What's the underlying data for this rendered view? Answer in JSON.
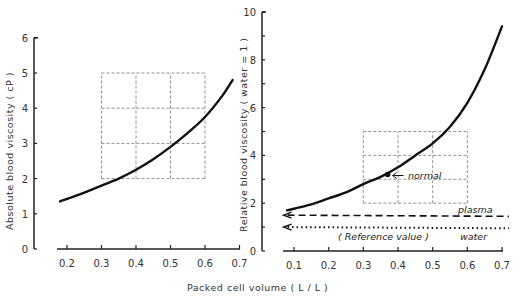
{
  "chart_data": [
    {
      "type": "line",
      "panel": "left",
      "title": "",
      "xlabel": "Packed cell volume (L/L)",
      "ylabel": "Absolute blood viscosity (cP)",
      "xlim": [
        0.17,
        0.7
      ],
      "ylim": [
        0,
        6
      ],
      "xticks": [
        0.2,
        0.3,
        0.4,
        0.5,
        0.6,
        0.7
      ],
      "xtick_labels": [
        "0.2",
        "0.3",
        "0.4",
        "0.5",
        "0.6",
        "0.7"
      ],
      "yticks": [
        0,
        1,
        2,
        3,
        4,
        5,
        6
      ],
      "ytick_labels": [
        "0",
        "1",
        "2",
        "3",
        "4",
        "5",
        "6"
      ],
      "grid": "dashed box x 0.3-0.6, y 2-5",
      "grid_box": {
        "x": [
          0.3,
          0.4,
          0.5,
          0.6
        ],
        "y": [
          2,
          3,
          4,
          5
        ]
      },
      "series": [
        {
          "name": "Absolute blood viscosity",
          "x": [
            0.18,
            0.25,
            0.3,
            0.35,
            0.4,
            0.45,
            0.5,
            0.55,
            0.6,
            0.65,
            0.68
          ],
          "y": [
            1.35,
            1.6,
            1.8,
            2.0,
            2.25,
            2.55,
            2.9,
            3.3,
            3.75,
            4.35,
            4.8
          ]
        }
      ]
    },
    {
      "type": "line",
      "panel": "right",
      "title": "",
      "xlabel": "Packed cell volume (L/L)",
      "ylabel": "Relative blood viscosity (water = 1)",
      "xlim": [
        0.07,
        0.72
      ],
      "ylim": [
        0,
        10
      ],
      "xticks": [
        0.1,
        0.2,
        0.3,
        0.4,
        0.5,
        0.6,
        0.7
      ],
      "xtick_labels": [
        "0.1",
        "0.2",
        "0.3",
        "0.4",
        "0.5",
        "0.6",
        "0.7"
      ],
      "yticks": [
        0,
        2,
        4,
        6,
        8,
        10
      ],
      "ytick_labels": [
        "0",
        "2",
        "4",
        "6",
        "8",
        "10"
      ],
      "grid": "dashed box x 0.3-0.6, y 2-5",
      "grid_box": {
        "x": [
          0.3,
          0.4,
          0.5,
          0.6
        ],
        "y": [
          2,
          3,
          4,
          5
        ]
      },
      "series": [
        {
          "name": "Relative blood viscosity",
          "x": [
            0.08,
            0.15,
            0.2,
            0.25,
            0.3,
            0.35,
            0.4,
            0.45,
            0.5,
            0.55,
            0.6,
            0.65,
            0.7
          ],
          "y": [
            1.7,
            1.95,
            2.2,
            2.45,
            2.8,
            3.1,
            3.5,
            4.0,
            4.5,
            5.2,
            6.2,
            7.6,
            9.4
          ]
        },
        {
          "name": "plasma",
          "style": "dashed",
          "x": [
            0.07,
            0.72
          ],
          "y": [
            1.5,
            1.45
          ]
        },
        {
          "name": "water",
          "style": "dotted",
          "x": [
            0.07,
            0.72
          ],
          "y": [
            1.0,
            0.95
          ]
        }
      ],
      "annotations": [
        {
          "text": "normal",
          "x": 0.37,
          "y": 3.2,
          "marker": "point with arrow"
        },
        {
          "text": "plasma",
          "x": 0.6,
          "y": 1.75
        },
        {
          "text": "(Reference value)",
          "x": 0.3,
          "y": 0.55
        },
        {
          "text": "water",
          "x": 0.6,
          "y": 0.55
        }
      ]
    }
  ],
  "labels": {
    "left_ylabel": "Absolute  blood  viscosity  ( cP )",
    "right_ylabel": "Relative  blood  viscosity  ( water = 1 )",
    "xlabel": "Packed   cell  volume  ( L / L )",
    "normal": "normal",
    "plasma": "plasma",
    "reference": "( Reference  value )",
    "water": "water"
  }
}
